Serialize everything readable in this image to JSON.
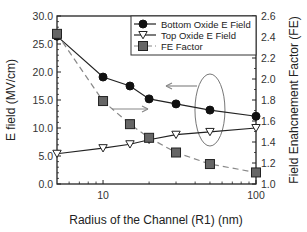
{
  "chart_data": {
    "type": "line",
    "title": "",
    "xlabel": "Radius of the Channel (R1) (nm)",
    "ylabel": "E field (MV/cm)",
    "ylabel_right": "Field Enahcnement Factor (FE)",
    "xscale": "log",
    "xlim": [
      5,
      100
    ],
    "ylim": [
      0,
      30
    ],
    "ylim_right": [
      1.0,
      2.6
    ],
    "x_ticks": [
      10,
      100
    ],
    "x_tick_labels": [
      "10",
      "100"
    ],
    "y_ticks": [
      0,
      5,
      10,
      15,
      20,
      25,
      30
    ],
    "y_tick_labels": [
      "0.0",
      "5.0",
      "10.0",
      "15.0",
      "20.0",
      "25.0",
      "30.0"
    ],
    "y_right_ticks": [
      1.0,
      1.2,
      1.4,
      1.6,
      1.8,
      2.0,
      2.2,
      2.4,
      2.6
    ],
    "y_right_tick_labels": [
      "1.0",
      "1.2",
      "1.4",
      "1.6",
      "1.8",
      "2.0",
      "2.2",
      "2.4",
      "2.6"
    ],
    "grid": false,
    "legend_position": "upper right",
    "x": [
      5,
      10,
      15,
      20,
      30,
      50,
      100
    ],
    "series": [
      {
        "name": "Bottom Oxide E Field",
        "axis": "left",
        "marker": "filled-circle",
        "line": "solid",
        "color": "#111111",
        "values": [
          26.4,
          19.1,
          17.5,
          15.2,
          14.3,
          13.2,
          12.1
        ]
      },
      {
        "name": "Top Oxide E Field",
        "axis": "left",
        "marker": "open-triangle-down",
        "line": "solid",
        "color": "#111111",
        "values": [
          5.4,
          6.4,
          7.1,
          7.9,
          8.8,
          9.3,
          10.0
        ]
      },
      {
        "name": "FE Factor",
        "axis": "right",
        "marker": "filled-square",
        "line": "dashed",
        "color": "#555555",
        "values": [
          2.43,
          1.79,
          1.57,
          1.44,
          1.3,
          1.19,
          1.11
        ]
      }
    ],
    "annotations": [
      {
        "type": "ellipse",
        "around_x": 50,
        "description": "ellipse around R1=50 data points"
      },
      {
        "type": "arrow",
        "direction": "left",
        "description": "points to left axis (E field)"
      },
      {
        "type": "arrow",
        "direction": "right",
        "description": "points to right axis (FE)"
      }
    ]
  }
}
